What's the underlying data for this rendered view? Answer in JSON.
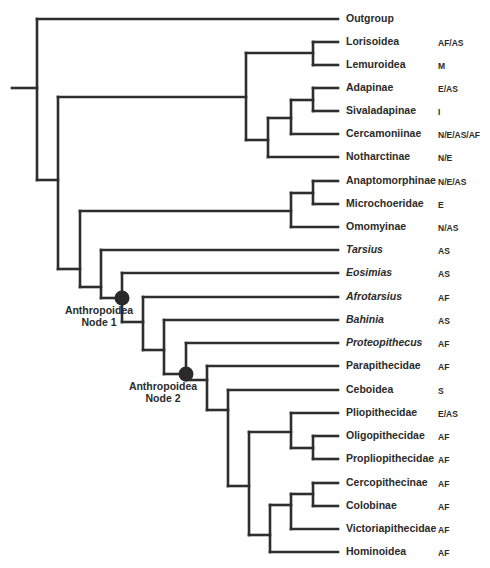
{
  "diagram": {
    "type": "phylogenetic-tree",
    "line_color": "#2e2e2e",
    "node_marker_color": "#2a2a2a",
    "leaves": [
      {
        "name": "Outgroup",
        "region": "",
        "italic": false,
        "y": 19
      },
      {
        "name": "Lorisoidea",
        "region": "AF/AS",
        "italic": false,
        "y": 42
      },
      {
        "name": "Lemuroidea",
        "region": "M",
        "italic": false,
        "y": 65
      },
      {
        "name": "Adapinae",
        "region": "E/AS",
        "italic": false,
        "y": 88
      },
      {
        "name": "Sivaladapinae",
        "region": "I",
        "italic": false,
        "y": 111
      },
      {
        "name": "Cercamoniinae",
        "region": "N/E/AS/AF",
        "italic": false,
        "y": 134
      },
      {
        "name": "Notharctinae",
        "region": "N/E",
        "italic": false,
        "y": 157
      },
      {
        "name": "Anaptomorphinae",
        "region": "N/E/AS",
        "italic": false,
        "y": 181
      },
      {
        "name": "Microchoeridae",
        "region": "E",
        "italic": false,
        "y": 204
      },
      {
        "name": "Omomyinae",
        "region": "N/AS",
        "italic": false,
        "y": 227
      },
      {
        "name": "Tarsius",
        "region": "AS",
        "italic": true,
        "y": 250
      },
      {
        "name": "Eosimias",
        "region": "AS",
        "italic": true,
        "y": 273
      },
      {
        "name": "Afrotarsius",
        "region": "AF",
        "italic": true,
        "y": 297
      },
      {
        "name": "Bahinia",
        "region": "AS",
        "italic": true,
        "y": 320
      },
      {
        "name": "Proteopithecus",
        "region": "AF",
        "italic": true,
        "y": 343
      },
      {
        "name": "Parapithecidae",
        "region": "AF",
        "italic": false,
        "y": 366
      },
      {
        "name": "Ceboidea",
        "region": "S",
        "italic": false,
        "y": 390
      },
      {
        "name": "Pliopithecidae",
        "region": "E/AS",
        "italic": false,
        "y": 413
      },
      {
        "name": "Oligopithecidae",
        "region": "AF",
        "italic": false,
        "y": 436
      },
      {
        "name": "Propliopithecidae",
        "region": "AF",
        "italic": false,
        "y": 459
      },
      {
        "name": "Cercopithecinae",
        "region": "AF",
        "italic": false,
        "y": 483
      },
      {
        "name": "Colobinae",
        "region": "AF",
        "italic": false,
        "y": 506
      },
      {
        "name": "Victoriapithecidae",
        "region": "AF",
        "italic": false,
        "y": 529
      },
      {
        "name": "Hominoidea",
        "region": "AF",
        "italic": false,
        "y": 552
      }
    ],
    "node_labels": [
      {
        "line1": "Anthropoidea",
        "line2": "Node 1",
        "cx": 122,
        "cy": 298
      },
      {
        "line1": "Anthropoidea",
        "line2": "Node 2",
        "cx": 186,
        "cy": 374
      }
    ],
    "root_stub": {
      "x1": 12,
      "x2": 37,
      "y": 88
    },
    "leaf_end_x": 338,
    "label_x": 346,
    "region_x": 438,
    "internal_nodes": [
      {
        "x": 37,
        "y1": 19,
        "y2": 180,
        "parent_x": null
      },
      {
        "x": 58,
        "y1": 97,
        "y2": 269,
        "join_y": 180,
        "parent_x": 37
      },
      {
        "x": 246,
        "y1": 53,
        "y2": 140,
        "join_y": 97,
        "parent_x": 58
      },
      {
        "x": 313,
        "y1": 42,
        "y2": 65,
        "join_y": 53,
        "parent_x": 246
      },
      {
        "x": 268,
        "y1": 118,
        "y2": 157,
        "join_y": 140,
        "parent_x": 246
      },
      {
        "x": 291,
        "y1": 100,
        "y2": 134,
        "join_y": 118,
        "parent_x": 268
      },
      {
        "x": 313,
        "y1": 88,
        "y2": 111,
        "join_y": 100,
        "parent_x": 291
      },
      {
        "x": 80,
        "y1": 211,
        "y2": 287,
        "join_y": 269,
        "parent_x": 58
      },
      {
        "x": 291,
        "y1": 193,
        "y2": 227,
        "join_y": 211,
        "parent_x": 80
      },
      {
        "x": 313,
        "y1": 181,
        "y2": 204,
        "join_y": 193,
        "parent_x": 291
      },
      {
        "x": 101,
        "y1": 250,
        "y2": 298,
        "join_y": 287,
        "parent_x": 80
      },
      {
        "x": 122,
        "y1": 273,
        "y2": 322,
        "join_y": 298,
        "parent_x": 101
      },
      {
        "x": 143,
        "y1": 297,
        "y2": 350,
        "join_y": 322,
        "parent_x": 122
      },
      {
        "x": 164,
        "y1": 320,
        "y2": 374,
        "join_y": 350,
        "parent_x": 143
      },
      {
        "x": 186,
        "y1": 343,
        "y2": 380,
        "join_y": 374,
        "parent_x": 164
      },
      {
        "x": 207,
        "y1": 366,
        "y2": 410,
        "join_y": 380,
        "parent_x": 186
      },
      {
        "x": 228,
        "y1": 390,
        "y2": 486,
        "join_y": 410,
        "parent_x": 207
      },
      {
        "x": 249,
        "y1": 432,
        "y2": 535,
        "join_y": 486,
        "parent_x": 228
      },
      {
        "x": 291,
        "y1": 413,
        "y2": 448,
        "join_y": 432,
        "parent_x": 249
      },
      {
        "x": 313,
        "y1": 436,
        "y2": 459,
        "join_y": 448,
        "parent_x": 291
      },
      {
        "x": 270,
        "y1": 505,
        "y2": 552,
        "join_y": 535,
        "parent_x": 249
      },
      {
        "x": 291,
        "y1": 494,
        "y2": 529,
        "join_y": 505,
        "parent_x": 270
      },
      {
        "x": 313,
        "y1": 483,
        "y2": 506,
        "join_y": 494,
        "parent_x": 291
      }
    ],
    "leaf_attach": [
      {
        "leaf": 0,
        "from_x": 37
      },
      {
        "leaf": 1,
        "from_x": 313
      },
      {
        "leaf": 2,
        "from_x": 313
      },
      {
        "leaf": 3,
        "from_x": 313
      },
      {
        "leaf": 4,
        "from_x": 313
      },
      {
        "leaf": 5,
        "from_x": 291
      },
      {
        "leaf": 6,
        "from_x": 268
      },
      {
        "leaf": 7,
        "from_x": 313
      },
      {
        "leaf": 8,
        "from_x": 313
      },
      {
        "leaf": 9,
        "from_x": 291
      },
      {
        "leaf": 10,
        "from_x": 101
      },
      {
        "leaf": 11,
        "from_x": 122
      },
      {
        "leaf": 12,
        "from_x": 143
      },
      {
        "leaf": 13,
        "from_x": 164
      },
      {
        "leaf": 14,
        "from_x": 186
      },
      {
        "leaf": 15,
        "from_x": 207
      },
      {
        "leaf": 16,
        "from_x": 228
      },
      {
        "leaf": 17,
        "from_x": 291
      },
      {
        "leaf": 18,
        "from_x": 313
      },
      {
        "leaf": 19,
        "from_x": 313
      },
      {
        "leaf": 20,
        "from_x": 313
      },
      {
        "leaf": 21,
        "from_x": 313
      },
      {
        "leaf": 22,
        "from_x": 291
      },
      {
        "leaf": 23,
        "from_x": 270
      }
    ]
  }
}
